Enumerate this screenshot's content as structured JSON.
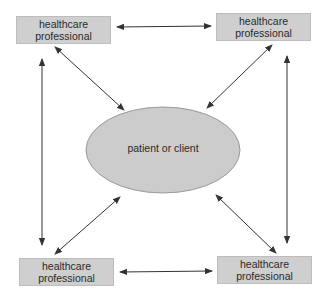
{
  "diagram": {
    "type": "relationship-network",
    "center": {
      "label": "patient or client",
      "shape": "ellipse",
      "fill": "#cccccc",
      "stroke": "#9a9a9a"
    },
    "nodes": [
      {
        "id": "top-left",
        "line1": "healthcare",
        "line2": "professional"
      },
      {
        "id": "top-right",
        "line1": "healthcare",
        "line2": "professional"
      },
      {
        "id": "bottom-left",
        "line1": "healthcare",
        "line2": "professional"
      },
      {
        "id": "bottom-right",
        "line1": "healthcare",
        "line2": "professional"
      }
    ],
    "connections": [
      {
        "from": "top-left",
        "to": "top-right",
        "direction": "bidirectional"
      },
      {
        "from": "bottom-left",
        "to": "bottom-right",
        "direction": "bidirectional"
      },
      {
        "from": "top-left",
        "to": "bottom-left",
        "direction": "bidirectional"
      },
      {
        "from": "top-right",
        "to": "bottom-right",
        "direction": "bidirectional"
      },
      {
        "from": "top-left",
        "to": "center",
        "direction": "bidirectional"
      },
      {
        "from": "top-right",
        "to": "center",
        "direction": "bidirectional"
      },
      {
        "from": "bottom-left",
        "to": "center",
        "direction": "bidirectional"
      },
      {
        "from": "bottom-right",
        "to": "center",
        "direction": "bidirectional"
      }
    ],
    "colors": {
      "box_fill": "#cfcfcf",
      "box_border": "#bdbdbd",
      "arrow": "#333333",
      "text": "#2a2a2a"
    }
  }
}
